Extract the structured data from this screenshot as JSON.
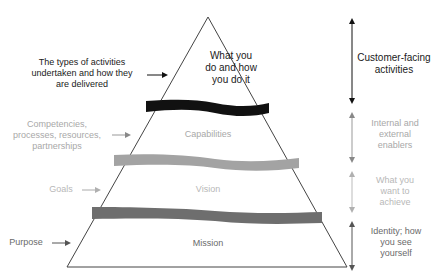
{
  "diagram": {
    "type": "pyramid",
    "levels": [
      {
        "name": "What you do and how you do it",
        "lines": [
          "What you",
          "do and how",
          "you do it"
        ],
        "left_note": [
          "The types of activities",
          "undertaken and how they",
          "are delivered"
        ],
        "right_note": [
          "Customer-facing",
          "activities"
        ],
        "band_color": "#111111"
      },
      {
        "name": "Capabilities",
        "lines": [
          "Capabilities"
        ],
        "left_note": [
          "Competencies,",
          "processes, resources,",
          "partnerships"
        ],
        "right_note": [
          "Internal and",
          "external",
          "enablers"
        ],
        "band_color": "#a3a3a3"
      },
      {
        "name": "Vision",
        "lines": [
          "Vision"
        ],
        "left_note": [
          "Goals"
        ],
        "right_note": [
          "What you",
          "want to",
          "achieve"
        ],
        "band_color": "#6e6e6e"
      },
      {
        "name": "Mission",
        "lines": [
          "Mission"
        ],
        "left_note": [
          "Purpose"
        ],
        "right_note": [
          "Identity; how",
          "you see",
          "yourself"
        ]
      }
    ]
  },
  "labels": {
    "top_inner": [
      "What you",
      "do and how",
      "you do it"
    ],
    "top_left": [
      "The types of activities",
      "undertaken and how they",
      "are delivered"
    ],
    "top_right": [
      "Customer-facing",
      "activities"
    ],
    "cap_inner": "Capabilities",
    "cap_left": [
      "Competencies,",
      "processes, resources,",
      "partnerships"
    ],
    "cap_right": [
      "Internal and",
      "external",
      "enablers"
    ],
    "vision_inner": "Vision",
    "vision_left": "Goals",
    "vision_right": [
      "What you",
      "want to",
      "achieve"
    ],
    "mission_inner": "Mission",
    "mission_left": "Purpose",
    "mission_right": [
      "Identity; how",
      "you see",
      "yourself"
    ]
  },
  "colors": {
    "outline": "#444444",
    "band_top": "#111111",
    "band_cap": "#a3a3a3",
    "band_vision": "#6e6e6e"
  }
}
